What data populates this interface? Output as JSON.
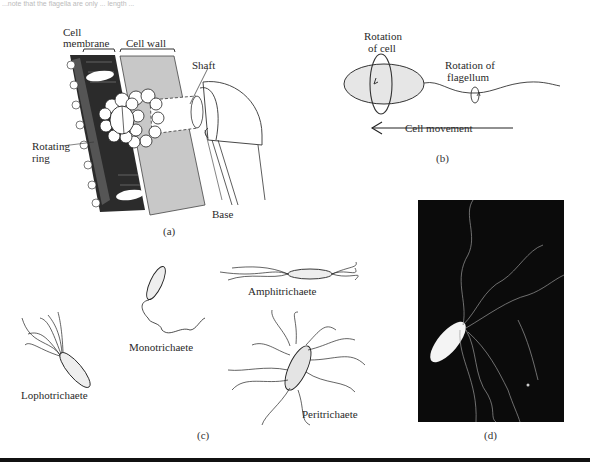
{
  "page": {
    "header_fragment": "...note that the flagella are only ... length ..."
  },
  "figure": {
    "panel_a": {
      "caption": "(a)",
      "labels": {
        "cell_membrane_line1": "Cell",
        "cell_membrane_line2": "membrane",
        "cell_wall": "Cell wall",
        "shaft": "Shaft",
        "rotating_ring_line1": "Rotating",
        "rotating_ring_line2": "ring",
        "base": "Base"
      }
    },
    "panel_b": {
      "caption": "(b)",
      "labels": {
        "rotation_cell_line1": "Rotation",
        "rotation_cell_line2": "of cell",
        "rotation_flagellum_line1": "Rotation of",
        "rotation_flagellum_line2": "flagellum",
        "cell_movement": "Cell movement"
      }
    },
    "panel_c": {
      "caption": "(c)",
      "types": [
        "Monotrichaete",
        "Amphitrichaete",
        "Lophotrichaete",
        "Peritrichaete"
      ]
    },
    "panel_d": {
      "caption": "(d)"
    }
  }
}
